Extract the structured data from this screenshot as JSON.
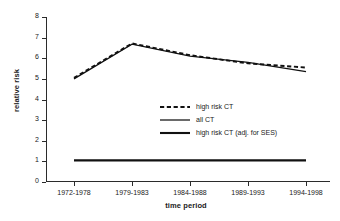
{
  "chart_data": {
    "type": "line",
    "title": "",
    "xlabel": "time period",
    "ylabel": "relative risk",
    "categories": [
      "1972-1978",
      "1979-1983",
      "1984-1988",
      "1989-1993",
      "1994-1998"
    ],
    "ylim": [
      0,
      8
    ],
    "yticks": [
      "0",
      "1",
      "2",
      "3",
      "4",
      "5",
      "6",
      "7",
      "8"
    ],
    "grid": false,
    "legend_position": "center-right",
    "series": [
      {
        "name": "high risk CT",
        "style": "dashed",
        "values": [
          5.05,
          6.72,
          6.15,
          5.75,
          5.55
        ]
      },
      {
        "name": "all CT",
        "style": "solid",
        "values": [
          5.0,
          6.68,
          6.1,
          5.8,
          5.35
        ]
      },
      {
        "name": "high risk CT (adj. for SES)",
        "style": "solid-thick",
        "values": [
          1.05,
          1.05,
          1.05,
          1.05,
          1.05
        ]
      }
    ]
  },
  "colors": {
    "axis": "#2b2b2b",
    "line": "#111111",
    "text": "#1a1a1a",
    "background": "#ffffff"
  }
}
